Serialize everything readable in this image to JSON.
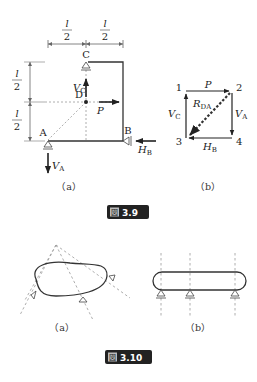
{
  "figure_3_9": {
    "label": "図 3.9",
    "label_prefix": "図",
    "label_number": "3.9",
    "panel_a": {
      "caption": "（a）",
      "dim_top_left": "l/2",
      "dim_top_right": "l/2",
      "dim_left_top": "l/2",
      "dim_left_bottom": "l/2",
      "point_c": "C",
      "point_d": "D",
      "point_a": "A",
      "point_b": "B",
      "force_vc": "V",
      "force_vc_sub": "C",
      "force_p": "P",
      "force_va": "V",
      "force_va_sub": "A",
      "force_hb": "H",
      "force_hb_sub": "B"
    },
    "panel_b": {
      "caption": "（b）",
      "node_1": "1",
      "node_2": "2",
      "node_3": "3",
      "node_4": "4",
      "edge_p": "P",
      "edge_vc": "V",
      "edge_vc_sub": "C",
      "edge_va": "V",
      "edge_va_sub": "A",
      "edge_hb": "H",
      "edge_hb_sub": "B",
      "diag_r": "R",
      "diag_r_sub": "DA"
    }
  },
  "figure_3_10": {
    "label": "図 3.10",
    "label_prefix": "図",
    "label_number": "3.10",
    "panel_a": {
      "caption": "（a）"
    },
    "panel_b": {
      "caption": "（b）"
    }
  },
  "colors": {
    "line": "#333333",
    "dashed": "#999999",
    "badge_bg": "#222222"
  }
}
